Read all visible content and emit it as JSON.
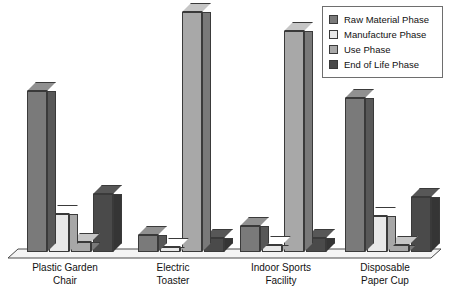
{
  "chart_data": {
    "type": "bar",
    "title": "",
    "subtitle": "",
    "xlabel": "",
    "ylabel": "",
    "grid": false,
    "legend_position": "top-right",
    "ylim": [
      0,
      100
    ],
    "categories": [
      "Plastic Garden\nChair",
      "Electric\nToaster",
      "Indoor Sports\nFacility",
      "Disposable\nPaper Cup"
    ],
    "series": [
      {
        "name": "Raw Material Phase",
        "color": "#7a7a7a",
        "values": [
          67,
          7,
          11,
          64
        ]
      },
      {
        "name": "Manufacture Phase",
        "color": "#e8e8e8",
        "values": [
          16,
          2,
          3,
          15
        ]
      },
      {
        "name": "Use Phase",
        "color": "#a8a8a8",
        "values": [
          4,
          100,
          92,
          3
        ]
      },
      {
        "name": "End of Life Phase",
        "color": "#4a4a4a",
        "values": [
          24,
          6,
          6,
          23
        ]
      }
    ]
  },
  "legend": {
    "items": [
      {
        "label": "Raw Material Phase",
        "color": "#7a7a7a"
      },
      {
        "label": "Manufacture Phase",
        "color": "#e8e8e8"
      },
      {
        "label": "Use Phase",
        "color": "#a8a8a8"
      },
      {
        "label": "End of Life Phase",
        "color": "#4a4a4a"
      }
    ]
  },
  "axis": {
    "labels": [
      "Plastic Garden\nChair",
      "Electric\nToaster",
      "Indoor Sports\nFacility",
      "Disposable\nPaper Cup"
    ]
  },
  "colors": {
    "raw_material": "#7a7a7a",
    "manufacture": "#e8e8e8",
    "use": "#a8a8a8",
    "end_of_life": "#4a4a4a",
    "floor": "#f2f2f2",
    "outline": "#3a3a3a",
    "background": "#ffffff"
  }
}
